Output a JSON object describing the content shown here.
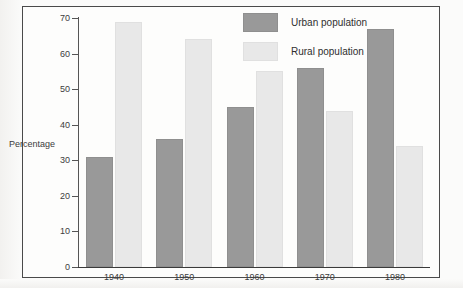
{
  "figure": {
    "clipped_caption": "",
    "background_color": "#fbfbfa",
    "frame_color": "#4a4a4a"
  },
  "legend": {
    "position": "inside-top-center",
    "entries": [
      {
        "label": "Urban population",
        "color": "#999999",
        "key": "urban"
      },
      {
        "label": "Rural population",
        "color": "#e8e8e8",
        "key": "rural"
      }
    ]
  },
  "axes": {
    "y_title": "Percentage",
    "y_ticks": [
      "70",
      "60",
      "50",
      "40",
      "30",
      "20",
      "10",
      "0"
    ],
    "x_ticks": [
      "1940",
      "1950",
      "1960",
      "1970",
      "1980"
    ]
  },
  "chart_data": {
    "type": "bar",
    "title": "",
    "xlabel": "",
    "ylabel": "Percentage",
    "ylim": [
      0,
      70
    ],
    "ytick_step": 10,
    "grid": false,
    "legend_position": "inside-top-center",
    "categories": [
      "1940",
      "1950",
      "1960",
      "1970",
      "1980"
    ],
    "series": [
      {
        "name": "Urban population",
        "color": "#999999",
        "values": [
          31,
          36,
          45,
          56,
          67
        ]
      },
      {
        "name": "Rural population",
        "color": "#e8e8e8",
        "values": [
          69,
          64,
          55,
          44,
          34
        ]
      }
    ]
  }
}
